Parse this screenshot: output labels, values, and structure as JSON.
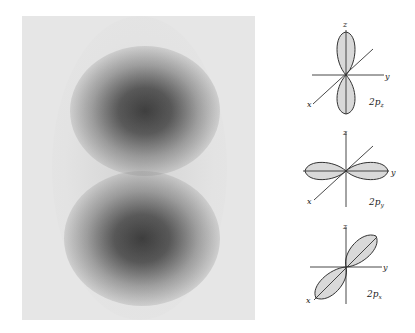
{
  "figure": {
    "density_image": {
      "description": "Electron density plot of a p orbital showing two dark lobes",
      "background_color": "#e6e6e6",
      "lobe_color": "#2a2a2a"
    },
    "orbitals": [
      {
        "name": "2p_z",
        "label_main": "2p",
        "label_sub": "z",
        "axes": {
          "z": "z",
          "y": "y",
          "x": "x"
        }
      },
      {
        "name": "2p_y",
        "label_main": "2p",
        "label_sub": "y",
        "axes": {
          "z": "z",
          "y": "y",
          "x": "x"
        }
      },
      {
        "name": "2p_x",
        "label_main": "2p",
        "label_sub": "x",
        "axes": {
          "z": "z",
          "y": "y",
          "x": "x"
        }
      }
    ],
    "colors": {
      "lobe_fill": "#d9d9d9",
      "line": "#333333"
    }
  }
}
